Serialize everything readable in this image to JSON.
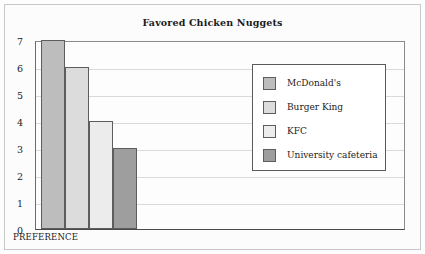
{
  "figure": {
    "title": "Favored Chicken Nuggets"
  },
  "axes": {
    "x_label": "PREFERENCE",
    "y_tick_labels": [
      "7",
      "6",
      "5",
      "4",
      "3",
      "2",
      "1",
      "0"
    ]
  },
  "legend": {
    "entries": [
      {
        "label": "McDonald's",
        "color": "#bdbdbd"
      },
      {
        "label": "Burger King",
        "color": "#dcdcdc"
      },
      {
        "label": "KFC",
        "color": "#ececec"
      },
      {
        "label": "University cafeteria",
        "color": "#9e9e9e"
      }
    ]
  },
  "chart_data": {
    "type": "bar",
    "title": "Favored Chicken Nuggets",
    "xlabel": "PREFERENCE",
    "ylabel": "",
    "categories": [
      "McDonald's",
      "Burger King",
      "KFC",
      "University cafeteria"
    ],
    "values": [
      7,
      6,
      4,
      3
    ],
    "colors": [
      "#bdbdbd",
      "#dcdcdc",
      "#ececec",
      "#9e9e9e"
    ],
    "ylim": [
      0,
      7
    ],
    "ytick_interval": 1,
    "yticks": [
      0,
      1,
      2,
      3,
      4,
      5,
      6,
      7
    ],
    "grid": true,
    "grid_axis": "y",
    "legend_position": "inside-upper-right",
    "bar_edge_color": "#5d5d5d"
  }
}
